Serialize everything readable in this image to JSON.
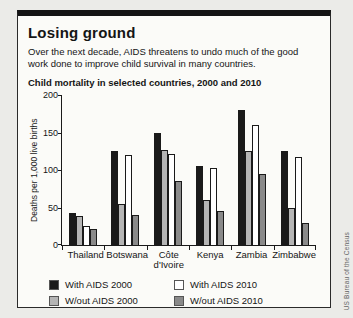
{
  "header": {
    "title": "Losing ground",
    "subtitle": "Over the next decade, AIDS threatens to undo much of the good work done to improve child survival in many countries."
  },
  "chart_data": {
    "type": "bar",
    "title": "Child mortality in selected countries, 2000 and 2010",
    "xlabel": "",
    "ylabel": "Deaths per 1,000 live births",
    "ylim": [
      0,
      200
    ],
    "y_ticks": [
      200,
      150,
      100,
      50,
      0
    ],
    "grid": false,
    "legend_position": "bottom",
    "categories": [
      "Thailand",
      "Botswana",
      "Côte\nd'Ivoire",
      "Kenya",
      "Zambia",
      "Zimbabwe"
    ],
    "series": [
      {
        "name": "With AIDS 2000",
        "color": "#1a1a1a",
        "values": [
          43,
          125,
          150,
          105,
          180,
          126
        ]
      },
      {
        "name": "W/out AIDS 2000",
        "color": "#b5b5b5",
        "values": [
          39,
          55,
          127,
          60,
          125,
          50
        ]
      },
      {
        "name": "With AIDS 2010",
        "color": "#ffffff",
        "values": [
          25,
          120,
          122,
          103,
          160,
          118
        ]
      },
      {
        "name": "W/out AIDS 2010",
        "color": "#8a8a8a",
        "values": [
          22,
          40,
          85,
          45,
          95,
          29
        ]
      }
    ],
    "legend": [
      {
        "label": "With AIDS 2000",
        "color": "#1a1a1a"
      },
      {
        "label": "With AIDS 2010",
        "color": "#ffffff"
      },
      {
        "label": "W/out AIDS 2000",
        "color": "#b5b5b5"
      },
      {
        "label": "W/out AIDS 2010",
        "color": "#8a8a8a"
      }
    ]
  },
  "source": "US Bureau of the Census"
}
